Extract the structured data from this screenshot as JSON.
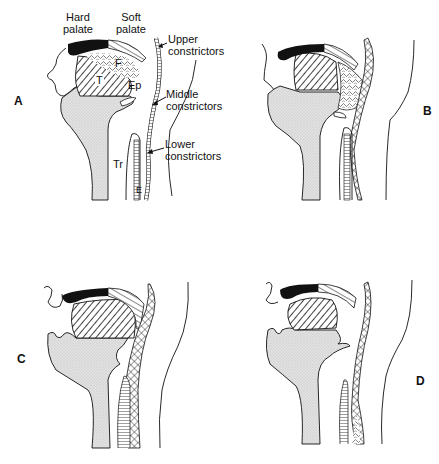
{
  "figure": {
    "panels": [
      {
        "id": "A",
        "letter": "A"
      },
      {
        "id": "B",
        "letter": "B"
      },
      {
        "id": "C",
        "letter": "C"
      },
      {
        "id": "D",
        "letter": "D"
      }
    ],
    "labels": {
      "hard_palate_1": "Hard",
      "hard_palate_2": "palate",
      "soft_palate_1": "Soft",
      "soft_palate_2": "palate",
      "F": "F",
      "T": "T",
      "Ep": "Ep",
      "Tr": "Tr",
      "E": "E",
      "upper_1": "Upper",
      "upper_2": "constrictors",
      "middle_1": "Middle",
      "middle_2": "constrictors",
      "lower_1": "Lower",
      "lower_2": "constrictors"
    },
    "colors": {
      "ink": "#111111",
      "stipple": "#d4d4d4",
      "background": "#ffffff"
    }
  }
}
